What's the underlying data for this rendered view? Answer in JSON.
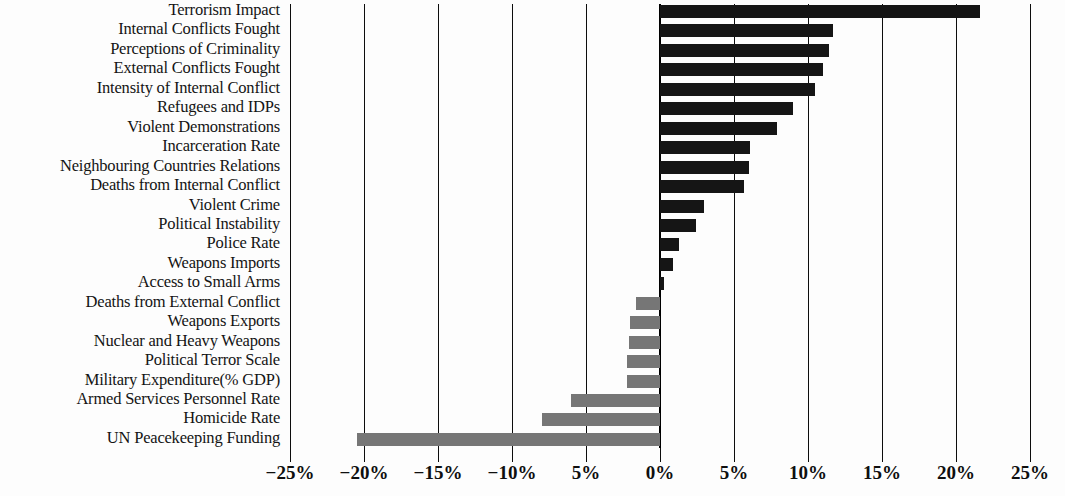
{
  "chart_data": {
    "type": "bar",
    "orientation": "horizontal",
    "title": "",
    "subtitle": "",
    "xlabel": "",
    "ylabel": "",
    "xlim": [
      -25,
      25
    ],
    "xticks": [
      -25,
      -20,
      -15,
      -10,
      -5,
      0,
      5,
      10,
      15,
      20,
      25
    ],
    "xtick_labels": [
      "−25%",
      "−20%",
      "−15%",
      "−10%",
      "5%",
      "0%",
      "5%",
      "10%",
      "15%",
      "20%",
      "25%"
    ],
    "grid": true,
    "legend": "none",
    "value_suffix": "%",
    "positive_color": "#151515",
    "negative_color": "#767676",
    "categories": [
      "Terrorism Impact",
      "Internal Conflicts Fought",
      "Perceptions of Criminality",
      "External Conflicts Fought",
      "Intensity of Internal Conflict",
      "Refugees and IDPs",
      "Violent Demonstrations",
      "Incarceration Rate",
      "Neighbouring Countries Relations",
      "Deaths from Internal Conflict",
      "Violent Crime",
      "Political Instability",
      "Police Rate",
      "Weapons Imports",
      "Access to Small Arms",
      "Deaths from External Conflict",
      "Weapons Exports",
      "Nuclear and Heavy Weapons",
      "Political Terror Scale",
      "Military Expenditure(% GDP)",
      "Armed Services Personnel Rate",
      "Homicide Rate",
      "UN Peacekeeping Funding"
    ],
    "values": [
      21.6,
      11.7,
      11.4,
      11.0,
      10.5,
      9.0,
      7.9,
      6.1,
      6.0,
      5.7,
      3.0,
      2.4,
      1.3,
      0.9,
      0.3,
      -1.6,
      -2.0,
      -2.1,
      -2.2,
      -2.2,
      -6.0,
      -8.0,
      -20.5
    ]
  }
}
